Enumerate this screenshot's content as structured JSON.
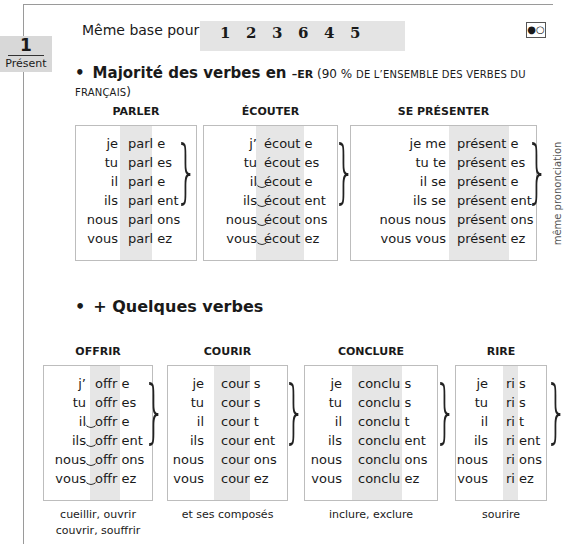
{
  "tab": {
    "number": "1",
    "label": "Présent"
  },
  "base": {
    "label": "Même base pour",
    "numbers": [
      "1",
      "2",
      "3",
      "6",
      "4",
      "5"
    ]
  },
  "toggle": {
    "icon": "half-filled-circles-icon",
    "glyph": "●○"
  },
  "section1": {
    "bullet": "•",
    "title": "Majorité des verbes en ",
    "ending": "–ER",
    "note_open": " (90 % ",
    "note_sc": "DE L’ENSEMBLE DES VERBES DU FRANÇAIS",
    "note_close": ")",
    "side_note": "même prononciation",
    "verbs": [
      {
        "name": "PARLER",
        "rows": [
          {
            "p": "je",
            "s": "parl",
            "e": "e"
          },
          {
            "p": "tu",
            "s": "parl",
            "e": "es"
          },
          {
            "p": "il",
            "s": "parl",
            "e": "e"
          },
          {
            "p": "ils",
            "s": "parl",
            "e": "ent"
          },
          {
            "p": "nous",
            "s": "parl",
            "e": "ons"
          },
          {
            "p": "vous",
            "s": "parl",
            "e": "ez"
          }
        ]
      },
      {
        "name": "ÉCOUTER",
        "rows": [
          {
            "p": "j’",
            "s": "écout",
            "e": "e"
          },
          {
            "p": "tu",
            "s": "écout",
            "e": "es"
          },
          {
            "p": "il",
            "s": "écout",
            "e": "e",
            "liaison": true
          },
          {
            "p": "ils",
            "s": "écout",
            "e": "ent",
            "liaison": true
          },
          {
            "p": "nous",
            "s": "écout",
            "e": "ons",
            "liaison": true
          },
          {
            "p": "vous",
            "s": "écout",
            "e": "ez",
            "liaison": true
          }
        ]
      },
      {
        "name": "SE PRÉSENTER",
        "rows": [
          {
            "p": "je me",
            "s": "présent",
            "e": "e"
          },
          {
            "p": "tu te",
            "s": "présent",
            "e": "es"
          },
          {
            "p": "il se",
            "s": "présent",
            "e": "e"
          },
          {
            "p": "ils se",
            "s": "présent",
            "e": "ent"
          },
          {
            "p": "nous nous",
            "s": "présent",
            "e": "ons"
          },
          {
            "p": "vous vous",
            "s": "présent",
            "e": "ez"
          }
        ]
      }
    ]
  },
  "section2": {
    "bullet": "•",
    "title": "+ Quelques verbes",
    "verbs": [
      {
        "name": "OFFRIR",
        "caption": [
          "cueillir, ouvrir",
          "couvrir, souffrir"
        ],
        "rows": [
          {
            "p": "j’",
            "s": "offr",
            "e": "e"
          },
          {
            "p": "tu",
            "s": "offr",
            "e": "es"
          },
          {
            "p": "il",
            "s": "offr",
            "e": "e",
            "liaison": true
          },
          {
            "p": "ils",
            "s": "offr",
            "e": "ent",
            "liaison": true
          },
          {
            "p": "nous",
            "s": "offr",
            "e": "ons",
            "liaison": true
          },
          {
            "p": "vous",
            "s": "offr",
            "e": "ez",
            "liaison": true
          }
        ]
      },
      {
        "name": "COURIR",
        "caption": [
          "et ses composés"
        ],
        "rows": [
          {
            "p": "je",
            "s": "cour",
            "e": "s"
          },
          {
            "p": "tu",
            "s": "cour",
            "e": "s"
          },
          {
            "p": "il",
            "s": "cour",
            "e": "t"
          },
          {
            "p": "ils",
            "s": "cour",
            "e": "ent"
          },
          {
            "p": "nous",
            "s": "cour",
            "e": "ons"
          },
          {
            "p": "vous",
            "s": "cour",
            "e": "ez"
          }
        ]
      },
      {
        "name": "CONCLURE",
        "caption": [
          "inclure, exclure"
        ],
        "rows": [
          {
            "p": "je",
            "s": "conclu",
            "e": "s"
          },
          {
            "p": "tu",
            "s": "conclu",
            "e": "s"
          },
          {
            "p": "il",
            "s": "conclu",
            "e": "t"
          },
          {
            "p": "ils",
            "s": "conclu",
            "e": "ent"
          },
          {
            "p": "nous",
            "s": "conclu",
            "e": "ons"
          },
          {
            "p": "vous",
            "s": "conclu",
            "e": "ez"
          }
        ]
      },
      {
        "name": "RIRE",
        "caption": [
          "sourire"
        ],
        "rows": [
          {
            "p": "je",
            "s": "ri",
            "e": "s"
          },
          {
            "p": "tu",
            "s": "ri",
            "e": "s"
          },
          {
            "p": "il",
            "s": "ri",
            "e": "t"
          },
          {
            "p": "ils",
            "s": "ri",
            "e": "ent"
          },
          {
            "p": "nous",
            "s": "ri",
            "e": "ons"
          },
          {
            "p": "vous",
            "s": "ri",
            "e": "ez"
          }
        ]
      }
    ]
  }
}
